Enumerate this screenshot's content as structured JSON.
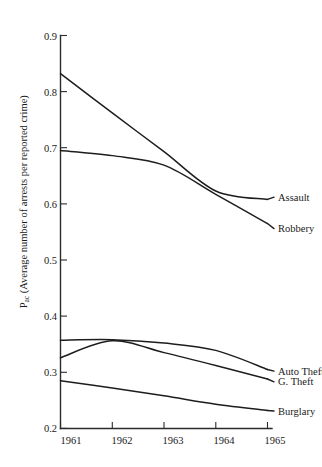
{
  "chart_data": {
    "type": "line",
    "title": "",
    "subtitle": "",
    "xlabel": "",
    "ylabel": "P_ac (Average number of arrests per reported crime)",
    "ylabel_main": "P",
    "ylabel_subscript": "ac",
    "ylabel_rest": " (Average number of arrests per reported crime)",
    "x": [
      1961,
      1962,
      1963,
      1964,
      1965
    ],
    "xtick_labels": [
      "1961",
      "1962",
      "1963",
      "1964",
      "1965"
    ],
    "ytick_labels": [
      "0.2",
      "0.3",
      "0.4",
      "0.5",
      "0.6",
      "0.7",
      "0.8",
      "0.9"
    ],
    "ytick_values": [
      0.2,
      0.3,
      0.4,
      0.5,
      0.6,
      0.7,
      0.8,
      0.9
    ],
    "xlim": [
      1961,
      1965
    ],
    "ylim": [
      0.2,
      0.9
    ],
    "grid": false,
    "legend_position": "right-inline-labels",
    "series": [
      {
        "name": "Assault",
        "label": "Assault",
        "values": [
          0.832,
          0.762,
          0.693,
          0.623,
          0.608
        ],
        "label_x": 1965.25,
        "label_y": 0.612
      },
      {
        "name": "Robbery",
        "label": "Robbery",
        "values": [
          0.695,
          0.686,
          0.669,
          0.617,
          0.565
        ],
        "label_x": 1965.25,
        "label_y": 0.556
      },
      {
        "name": "Auto Theft",
        "label": "Auto Theft",
        "values": [
          0.357,
          0.358,
          0.352,
          0.339,
          0.305
        ],
        "label_x": 1965.25,
        "label_y": 0.302
      },
      {
        "name": "G. Theft",
        "label": "G. Theft",
        "values": [
          0.326,
          0.356,
          0.335,
          0.312,
          0.288
        ],
        "label_x": 1965.25,
        "label_y": 0.283
      },
      {
        "name": "Burglary",
        "label": "Burglary",
        "values": [
          0.285,
          0.272,
          0.258,
          0.243,
          0.232
        ],
        "label_x": 1965.25,
        "label_y": 0.231
      }
    ],
    "colors": {
      "line": "#1d1d1d",
      "axis": "#2b2b2b",
      "text": "#1a1a1a",
      "background": "#ffffff"
    }
  },
  "caption": {
    "text": ""
  }
}
